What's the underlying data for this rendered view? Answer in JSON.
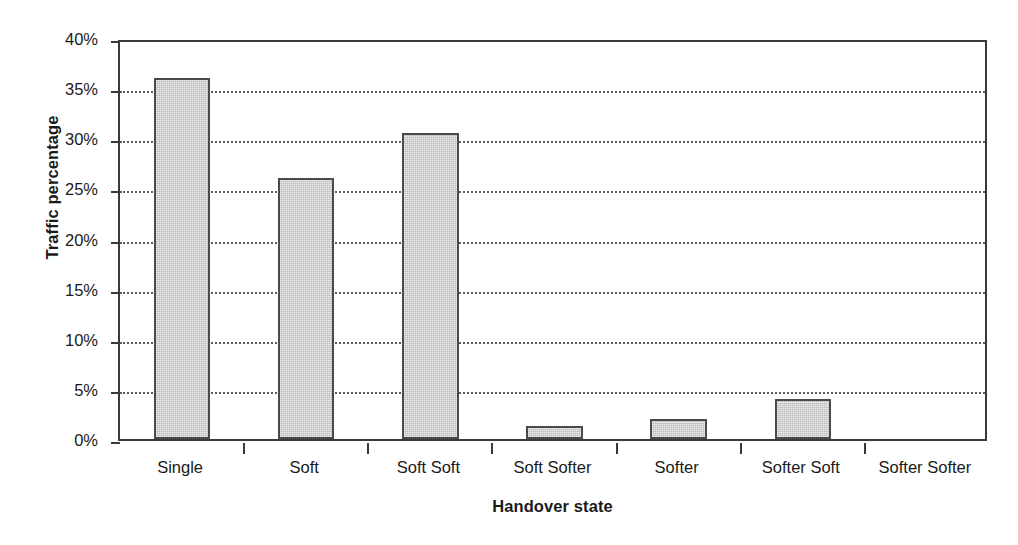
{
  "chart_data": {
    "type": "bar",
    "title": "",
    "xlabel": "Handover state",
    "ylabel": "Traffic percentage",
    "categories": [
      "Single",
      "Soft",
      "Soft Soft",
      "Soft Softer",
      "Softer",
      "Softer Soft",
      "Softer Softer"
    ],
    "values": [
      36.0,
      26.0,
      30.5,
      1.3,
      2.0,
      4.0,
      0.0
    ],
    "ylim": [
      0,
      40
    ],
    "ytick_values": [
      0,
      5,
      10,
      15,
      20,
      25,
      30,
      35,
      40
    ],
    "ytick_labels": [
      "0%",
      "5%",
      "10%",
      "15%",
      "20%",
      "25%",
      "30%",
      "35%",
      "40%"
    ],
    "grid": true,
    "grid_axis": "y",
    "grid_style": "dotted",
    "legend": false,
    "legend_position": "none",
    "bar_fill_color": "#cdcdcd",
    "bar_edge_color": "#4a4a4a",
    "axis_color": "#3a3a3a",
    "background_color": "#ffffff"
  }
}
